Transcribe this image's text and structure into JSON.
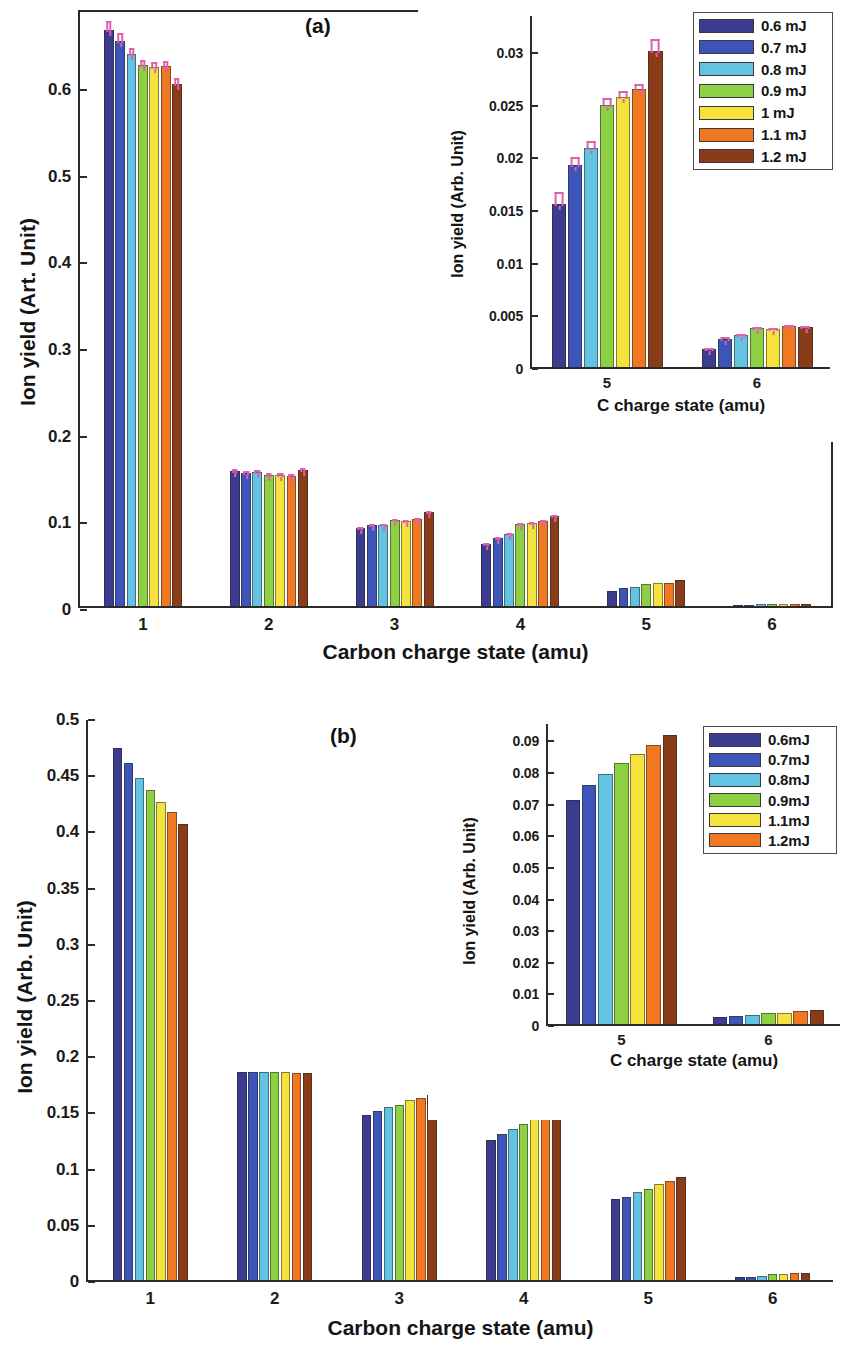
{
  "figure": {
    "panels": [
      "a",
      "b"
    ],
    "background": "#ffffff"
  },
  "palette": {
    "c1": "#3b3b8f",
    "c2": "#3d55b8",
    "c3": "#62c4e2",
    "c4": "#8dd044",
    "c5": "#f5e23c",
    "c6": "#f07820",
    "c7": "#8a3c18",
    "error": "#e060b0"
  },
  "panel_a": {
    "tag": "(a)",
    "ylabel": "Ion yield (Art. Unit)",
    "xlabel": "Carbon charge state (amu)",
    "yticks": [
      "0",
      "0.1",
      "0.2",
      "0.3",
      "0.4",
      "0.5",
      "0.6"
    ],
    "xticks": [
      "1",
      "2",
      "3",
      "4",
      "5",
      "6"
    ],
    "legend": [
      {
        "label": "0.6 mJ",
        "color": "#3b3b8f"
      },
      {
        "label": "0.7 mJ",
        "color": "#3d55b8"
      },
      {
        "label": "0.8 mJ",
        "color": "#62c4e2"
      },
      {
        "label": "0.9 mJ",
        "color": "#8dd044"
      },
      {
        "label": "1 mJ",
        "color": "#f5e23c"
      },
      {
        "label": "1.1 mJ",
        "color": "#f07820"
      },
      {
        "label": "1.2 mJ",
        "color": "#8a3c18"
      }
    ],
    "inset": {
      "ylabel": "Ion yield (Arb. Unit)",
      "xlabel": "C charge state (amu)",
      "yticks": [
        "0",
        "0.005",
        "0.01",
        "0.015",
        "0.02",
        "0.025",
        "0.03"
      ],
      "xticks": [
        "5",
        "6"
      ]
    }
  },
  "panel_b": {
    "tag": "(b)",
    "ylabel": "Ion yield (Arb. Unit)",
    "xlabel": "Carbon charge state (amu)",
    "yticks": [
      "0",
      "0.05",
      "0.1",
      "0.15",
      "0.2",
      "0.25",
      "0.3",
      "0.35",
      "0.4",
      "0.45",
      "0.5"
    ],
    "xticks": [
      "1",
      "2",
      "3",
      "4",
      "5",
      "6"
    ],
    "legend": [
      {
        "label": "0.6mJ",
        "color": "#3b3b8f"
      },
      {
        "label": "0.7mJ",
        "color": "#3d55b8"
      },
      {
        "label": "0.8mJ",
        "color": "#62c4e2"
      },
      {
        "label": "0.9mJ",
        "color": "#8dd044"
      },
      {
        "label": "1.1mJ",
        "color": "#f5e23c"
      },
      {
        "label": "1.2mJ",
        "color": "#f07820"
      }
    ],
    "inset": {
      "ylabel": "Ion yield (Arb. Unit)",
      "xlabel": "C charge state (amu)",
      "yticks": [
        "0",
        "0.01",
        "0.02",
        "0.03",
        "0.04",
        "0.05",
        "0.06",
        "0.07",
        "0.08",
        "0.09"
      ],
      "xticks": [
        "5",
        "6"
      ]
    }
  },
  "chart_data": [
    {
      "id": "panel_a_main",
      "type": "bar",
      "title": "(a)",
      "xlabel": "Carbon charge state (amu)",
      "ylabel": "Ion yield (Art. Unit)",
      "categories": [
        "1",
        "2",
        "3",
        "4",
        "5",
        "6"
      ],
      "ylim": [
        0,
        0.69
      ],
      "yticks": [
        0,
        0.1,
        0.2,
        0.3,
        0.4,
        0.5,
        0.6
      ],
      "grid": false,
      "legend_position": "top-right-outside",
      "errorbars": true,
      "series": [
        {
          "name": "0.6 mJ",
          "color": "#3b3b8f",
          "values": [
            0.665,
            0.156,
            0.09,
            0.072,
            0.017,
            0.0015
          ],
          "errors": [
            0.008,
            0.003,
            0.002,
            0.002,
            0.001,
            0.0004
          ]
        },
        {
          "name": "0.7 mJ",
          "color": "#3d55b8",
          "values": [
            0.652,
            0.153,
            0.093,
            0.079,
            0.021,
            0.0017
          ],
          "errors": [
            0.007,
            0.003,
            0.002,
            0.002,
            0.001,
            0.0004
          ]
        },
        {
          "name": "0.8 mJ",
          "color": "#62c4e2",
          "values": [
            0.637,
            0.155,
            0.094,
            0.083,
            0.022,
            0.0018
          ],
          "errors": [
            0.006,
            0.003,
            0.002,
            0.002,
            0.001,
            0.0004
          ]
        },
        {
          "name": "0.9 mJ",
          "color": "#8dd044",
          "values": [
            0.624,
            0.151,
            0.099,
            0.095,
            0.025,
            0.002
          ],
          "errors": [
            0.005,
            0.003,
            0.002,
            0.002,
            0.001,
            0.0004
          ]
        },
        {
          "name": "1 mJ",
          "color": "#f5e23c",
          "values": [
            0.622,
            0.151,
            0.098,
            0.096,
            0.026,
            0.0021
          ],
          "errors": [
            0.005,
            0.003,
            0.002,
            0.002,
            0.001,
            0.0004
          ]
        },
        {
          "name": "1.1 mJ",
          "color": "#f07820",
          "values": [
            0.623,
            0.15,
            0.1,
            0.098,
            0.027,
            0.0022
          ],
          "errors": [
            0.005,
            0.003,
            0.002,
            0.002,
            0.001,
            0.0004
          ]
        },
        {
          "name": "1.2 mJ",
          "color": "#8a3c18",
          "values": [
            0.602,
            0.157,
            0.108,
            0.104,
            0.03,
            0.0023
          ],
          "errors": [
            0.006,
            0.003,
            0.002,
            0.002,
            0.001,
            0.0004
          ]
        }
      ]
    },
    {
      "id": "panel_a_inset",
      "type": "bar",
      "title": "",
      "xlabel": "C charge state (amu)",
      "ylabel": "Ion yield (Arb. Unit)",
      "categories": [
        "5",
        "6"
      ],
      "ylim": [
        0,
        0.0335
      ],
      "yticks": [
        0,
        0.005,
        0.01,
        0.015,
        0.02,
        0.025,
        0.03
      ],
      "grid": false,
      "errorbars": true,
      "series": [
        {
          "name": "0.6 mJ",
          "color": "#3b3b8f",
          "values": [
            0.0155,
            0.0017
          ],
          "errors": [
            0.0008,
            0.0002
          ]
        },
        {
          "name": "0.7 mJ",
          "color": "#3d55b8",
          "values": [
            0.0192,
            0.0027
          ],
          "errors": [
            0.0006,
            0.0002
          ]
        },
        {
          "name": "0.8 mJ",
          "color": "#62c4e2",
          "values": [
            0.0208,
            0.003
          ],
          "errors": [
            0.0005,
            0.0002
          ]
        },
        {
          "name": "0.9 mJ",
          "color": "#8dd044",
          "values": [
            0.0249,
            0.0037
          ],
          "errors": [
            0.0005,
            0.0002
          ]
        },
        {
          "name": "1 mJ",
          "color": "#f5e23c",
          "values": [
            0.0256,
            0.0036
          ],
          "errors": [
            0.0005,
            0.0002
          ]
        },
        {
          "name": "1.1 mJ",
          "color": "#f07820",
          "values": [
            0.0264,
            0.0039
          ],
          "errors": [
            0.0004,
            0.0002
          ]
        },
        {
          "name": "1.2 mJ",
          "color": "#8a3c18",
          "values": [
            0.03,
            0.0038
          ],
          "errors": [
            0.0008,
            0.0002
          ]
        }
      ]
    },
    {
      "id": "panel_b_main",
      "type": "bar",
      "title": "(b)",
      "xlabel": "Carbon charge state (amu)",
      "ylabel": "Ion yield (Arb. Unit)",
      "categories": [
        "1",
        "2",
        "3",
        "4",
        "5",
        "6"
      ],
      "ylim": [
        0,
        0.5
      ],
      "yticks": [
        0,
        0.05,
        0.1,
        0.15,
        0.2,
        0.25,
        0.3,
        0.35,
        0.4,
        0.45,
        0.5
      ],
      "grid": false,
      "legend_position": "top-right-outside",
      "errorbars": false,
      "series": [
        {
          "name": "0.6mJ",
          "color": "#3b3b8f",
          "values": [
            0.473,
            0.185,
            0.147,
            0.125,
            0.072,
            0.003
          ]
        },
        {
          "name": "0.7mJ",
          "color": "#3d55b8",
          "values": [
            0.46,
            0.185,
            0.15,
            0.13,
            0.074,
            0.003
          ]
        },
        {
          "name": "0.8mJ",
          "color": "#62c4e2",
          "values": [
            0.447,
            0.185,
            0.154,
            0.134,
            0.078,
            0.004
          ]
        },
        {
          "name": "0.9mJ",
          "color": "#8dd044",
          "values": [
            0.436,
            0.185,
            0.156,
            0.139,
            0.081,
            0.005
          ]
        },
        {
          "name": "1.1mJ",
          "color": "#f5e23c",
          "values": [
            0.425,
            0.185,
            0.16,
            0.143,
            0.085,
            0.005
          ]
        },
        {
          "name": "1.2mJ",
          "color": "#f07820",
          "values": [
            0.416,
            0.184,
            0.162,
            0.147,
            0.088,
            0.006
          ]
        },
        {
          "name": "extra",
          "color": "#8a3c18",
          "values": [
            0.406,
            0.184,
            0.165,
            0.151,
            0.092,
            0.006
          ]
        }
      ]
    },
    {
      "id": "panel_b_inset",
      "type": "bar",
      "title": "",
      "xlabel": "C charge state (amu)",
      "ylabel": "Ion yield (Arb. Unit)",
      "categories": [
        "5",
        "6"
      ],
      "ylim": [
        0,
        0.0955
      ],
      "yticks": [
        0,
        0.01,
        0.02,
        0.03,
        0.04,
        0.05,
        0.06,
        0.07,
        0.08,
        0.09
      ],
      "grid": false,
      "errorbars": false,
      "series": [
        {
          "name": "0.6mJ",
          "color": "#3b3b8f",
          "values": [
            0.0708,
            0.0022
          ]
        },
        {
          "name": "0.7mJ",
          "color": "#3d55b8",
          "values": [
            0.0755,
            0.0026
          ]
        },
        {
          "name": "0.8mJ",
          "color": "#62c4e2",
          "values": [
            0.0791,
            0.0029
          ]
        },
        {
          "name": "0.9mJ",
          "color": "#8dd044",
          "values": [
            0.0826,
            0.0034
          ]
        },
        {
          "name": "1.1mJ",
          "color": "#f5e23c",
          "values": [
            0.0855,
            0.0035
          ]
        },
        {
          "name": "1.2mJ",
          "color": "#f07820",
          "values": [
            0.0882,
            0.004
          ]
        },
        {
          "name": "extra",
          "color": "#8a3c18",
          "values": [
            0.0913,
            0.0045
          ]
        }
      ]
    }
  ]
}
